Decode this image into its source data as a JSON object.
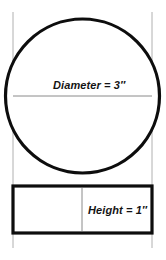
{
  "figure": {
    "shapes": {
      "circle": {
        "name": "top-view-circle",
        "center_x": 82.5,
        "center_y": 96,
        "radius": 77,
        "stroke_color": "#0d0d0d",
        "stroke_width": 3.2,
        "fill": "#ffffff"
      },
      "diameter_line": {
        "name": "diameter-line",
        "x1": 13,
        "x2": 152,
        "y": 96,
        "stroke_color": "#8a8a8a",
        "stroke_width": 1
      },
      "rectangle": {
        "name": "side-view-rectangle",
        "x": 13,
        "y": 186,
        "width": 139,
        "height": 47,
        "stroke_color": "#0d0d0d",
        "stroke_width": 3.2,
        "fill": "#ffffff"
      },
      "rectangle_divider": {
        "name": "rectangle-divider-line",
        "x": 82,
        "y1": 188,
        "y2": 231,
        "stroke_color": "#8a8a8a",
        "stroke_width": 1
      },
      "guide_left": {
        "name": "left-extension-line",
        "x": 13,
        "y1": 12,
        "y2": 248,
        "stroke_color": "#b0b0b0",
        "stroke_width": 1
      },
      "guide_right": {
        "name": "right-extension-line",
        "x": 152,
        "y1": 12,
        "y2": 248,
        "stroke_color": "#b0b0b0",
        "stroke_width": 1
      }
    },
    "labels": {
      "diameter": "Diameter = 3″",
      "height": "Height = 1″"
    },
    "colors": {
      "background": "#ffffff",
      "outline": "#0d0d0d",
      "guide": "#b0b0b0",
      "divider": "#8a8a8a",
      "text": "#141414"
    }
  }
}
